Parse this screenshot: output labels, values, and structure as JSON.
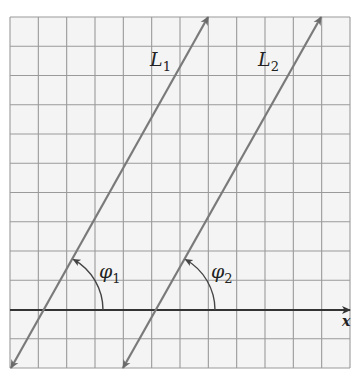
{
  "diagram": {
    "type": "parallel-lines-inclination",
    "colors": {
      "background": "#ffffff",
      "grid_fill": "#f4f4f4",
      "grid_line": "#9a9a9a",
      "axis": "#333333",
      "line": "#7a7a7a",
      "arc": "#444444",
      "text": "#222222"
    },
    "grid": {
      "x0": 10,
      "y0": 17,
      "x1": 350,
      "y1": 368,
      "cols": 12,
      "rows": 12
    },
    "x_axis": {
      "y": 310,
      "label": "x"
    },
    "lines": [
      {
        "id": "L1",
        "label": "L",
        "subscript": "1",
        "from": [
          11,
          368
        ],
        "to": [
          208,
          17
        ],
        "label_pos": [
          150,
          66
        ]
      },
      {
        "id": "L2",
        "label": "L",
        "subscript": "2",
        "from": [
          123,
          368
        ],
        "to": [
          321,
          17
        ],
        "label_pos": [
          258,
          66
        ]
      }
    ],
    "angles": [
      {
        "id": "phi1",
        "label": "φ",
        "subscript": "1",
        "center": [
          45,
          310
        ],
        "radius": 58,
        "label_pos": [
          99,
          278
        ]
      },
      {
        "id": "phi2",
        "label": "φ",
        "subscript": "2",
        "center": [
          157,
          310
        ],
        "radius": 58,
        "label_pos": [
          211,
          278
        ]
      }
    ]
  }
}
